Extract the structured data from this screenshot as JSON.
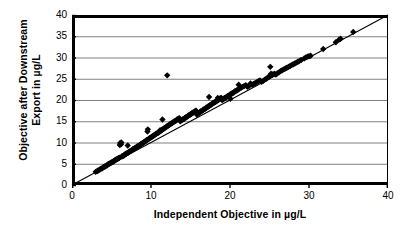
{
  "chart_data": {
    "type": "scatter",
    "title": "",
    "xlabel": "Independent Objective in µg/L",
    "ylabel_line1": "Objective after Downstream",
    "ylabel_line2": "Export in µg/L",
    "xlim": [
      0,
      40
    ],
    "ylim": [
      0,
      40
    ],
    "xticks": [
      0,
      10,
      20,
      30,
      40
    ],
    "yticks": [
      0,
      5,
      10,
      15,
      20,
      25,
      30,
      35,
      40
    ],
    "xtick_labels": [
      "0",
      "10",
      "20",
      "30",
      "40"
    ],
    "ytick_labels": [
      "0",
      "5",
      "10",
      "15",
      "20",
      "25",
      "30",
      "35",
      "40"
    ],
    "grid": "horizontal",
    "grid_color": "#808080",
    "axis_color": "#000000",
    "marker": "diamond",
    "marker_color": "#000000",
    "marker_size": 4.2,
    "legend": null,
    "reference_line": {
      "name": "1:1 line",
      "from": [
        0,
        0
      ],
      "to": [
        40,
        40
      ],
      "color": "#000000",
      "width": 1.1
    },
    "points": [
      [
        3.0,
        3.1
      ],
      [
        3.2,
        3.3
      ],
      [
        3.3,
        3.4
      ],
      [
        3.5,
        3.6
      ],
      [
        3.6,
        3.8
      ],
      [
        3.8,
        3.9
      ],
      [
        3.9,
        4.1
      ],
      [
        4.0,
        4.2
      ],
      [
        4.1,
        4.3
      ],
      [
        4.2,
        4.4
      ],
      [
        4.3,
        4.5
      ],
      [
        4.4,
        4.6
      ],
      [
        4.5,
        4.8
      ],
      [
        4.6,
        4.9
      ],
      [
        4.7,
        5.0
      ],
      [
        4.8,
        5.1
      ],
      [
        4.9,
        5.2
      ],
      [
        5.0,
        5.3
      ],
      [
        5.1,
        5.4
      ],
      [
        5.2,
        5.5
      ],
      [
        5.3,
        5.6
      ],
      [
        5.4,
        5.8
      ],
      [
        5.5,
        5.9
      ],
      [
        5.6,
        6.0
      ],
      [
        5.7,
        6.1
      ],
      [
        5.8,
        6.2
      ],
      [
        5.9,
        6.3
      ],
      [
        6.0,
        6.4
      ],
      [
        6.05,
        9.4
      ],
      [
        6.1,
        9.9
      ],
      [
        6.2,
        9.6
      ],
      [
        6.25,
        10.0
      ],
      [
        6.3,
        6.7
      ],
      [
        6.4,
        6.8
      ],
      [
        6.5,
        6.9
      ],
      [
        6.6,
        7.0
      ],
      [
        6.7,
        7.2
      ],
      [
        6.8,
        7.3
      ],
      [
        6.9,
        7.4
      ],
      [
        7.0,
        7.5
      ],
      [
        7.05,
        9.3
      ],
      [
        7.1,
        7.6
      ],
      [
        7.2,
        7.8
      ],
      [
        7.3,
        7.9
      ],
      [
        7.4,
        8.0
      ],
      [
        7.5,
        8.1
      ],
      [
        7.6,
        8.2
      ],
      [
        7.7,
        8.4
      ],
      [
        7.8,
        8.5
      ],
      [
        7.9,
        8.6
      ],
      [
        8.0,
        8.7
      ],
      [
        8.1,
        8.8
      ],
      [
        8.2,
        9.0
      ],
      [
        8.3,
        9.1
      ],
      [
        8.4,
        9.2
      ],
      [
        8.5,
        9.3
      ],
      [
        8.6,
        9.4
      ],
      [
        8.7,
        9.6
      ],
      [
        8.8,
        9.7
      ],
      [
        8.9,
        9.8
      ],
      [
        9.0,
        9.9
      ],
      [
        9.1,
        10.1
      ],
      [
        9.2,
        10.2
      ],
      [
        9.3,
        10.3
      ],
      [
        9.4,
        10.5
      ],
      [
        9.5,
        10.6
      ],
      [
        9.55,
        12.6
      ],
      [
        9.6,
        13.1
      ],
      [
        9.7,
        10.8
      ],
      [
        9.8,
        11.0
      ],
      [
        9.9,
        11.1
      ],
      [
        10.0,
        11.2
      ],
      [
        10.1,
        11.3
      ],
      [
        10.2,
        11.5
      ],
      [
        10.3,
        11.6
      ],
      [
        10.4,
        11.7
      ],
      [
        10.5,
        11.8
      ],
      [
        10.6,
        12.0
      ],
      [
        10.7,
        12.1
      ],
      [
        10.8,
        12.2
      ],
      [
        10.9,
        12.3
      ],
      [
        11.0,
        12.4
      ],
      [
        11.1,
        12.6
      ],
      [
        11.15,
        12.9
      ],
      [
        11.2,
        12.7
      ],
      [
        11.3,
        12.8
      ],
      [
        11.4,
        13.0
      ],
      [
        11.45,
        15.4
      ],
      [
        11.5,
        13.1
      ],
      [
        11.6,
        13.2
      ],
      [
        11.7,
        13.4
      ],
      [
        11.8,
        13.5
      ],
      [
        11.9,
        13.6
      ],
      [
        12.0,
        13.8
      ],
      [
        12.05,
        25.8
      ],
      [
        12.1,
        13.9
      ],
      [
        12.2,
        14.0
      ],
      [
        12.3,
        14.1
      ],
      [
        12.4,
        14.3
      ],
      [
        12.5,
        14.4
      ],
      [
        12.6,
        14.5
      ],
      [
        12.7,
        14.6
      ],
      [
        12.8,
        14.8
      ],
      [
        12.9,
        14.9
      ],
      [
        13.0,
        15.0
      ],
      [
        13.1,
        15.1
      ],
      [
        13.2,
        15.2
      ],
      [
        13.3,
        15.4
      ],
      [
        13.4,
        15.5
      ],
      [
        13.5,
        15.6
      ],
      [
        13.6,
        15.7
      ],
      [
        13.7,
        15.0
      ],
      [
        13.8,
        15.2
      ],
      [
        13.9,
        15.3
      ],
      [
        14.0,
        15.4
      ],
      [
        14.1,
        15.5
      ],
      [
        14.2,
        15.6
      ],
      [
        14.3,
        15.8
      ],
      [
        14.4,
        15.9
      ],
      [
        14.5,
        16.0
      ],
      [
        14.6,
        16.1
      ],
      [
        14.7,
        16.3
      ],
      [
        14.8,
        16.4
      ],
      [
        14.9,
        16.5
      ],
      [
        15.0,
        16.6
      ],
      [
        15.1,
        16.8
      ],
      [
        15.2,
        16.9
      ],
      [
        15.3,
        17.0
      ],
      [
        15.4,
        17.1
      ],
      [
        15.5,
        17.2
      ],
      [
        15.6,
        17.4
      ],
      [
        15.7,
        17.5
      ],
      [
        15.8,
        16.6
      ],
      [
        15.9,
        16.8
      ],
      [
        16.0,
        16.9
      ],
      [
        16.1,
        17.0
      ],
      [
        16.2,
        17.2
      ],
      [
        16.3,
        17.3
      ],
      [
        16.4,
        17.4
      ],
      [
        16.5,
        17.5
      ],
      [
        16.6,
        17.7
      ],
      [
        16.7,
        17.8
      ],
      [
        16.8,
        17.9
      ],
      [
        16.9,
        18.0
      ],
      [
        17.0,
        18.2
      ],
      [
        17.1,
        18.3
      ],
      [
        17.2,
        18.4
      ],
      [
        17.3,
        18.5
      ],
      [
        17.35,
        20.7
      ],
      [
        17.4,
        18.7
      ],
      [
        17.5,
        18.8
      ],
      [
        17.6,
        18.9
      ],
      [
        17.7,
        19.0
      ],
      [
        17.8,
        19.2
      ],
      [
        17.9,
        19.3
      ],
      [
        18.0,
        19.4
      ],
      [
        18.1,
        19.5
      ],
      [
        18.2,
        19.6
      ],
      [
        18.3,
        19.8
      ],
      [
        18.4,
        19.9
      ],
      [
        18.45,
        20.5
      ],
      [
        18.5,
        20.0
      ],
      [
        18.6,
        20.1
      ],
      [
        18.7,
        20.3
      ],
      [
        18.8,
        20.4
      ],
      [
        18.9,
        20.5
      ],
      [
        19.0,
        20.0
      ],
      [
        19.1,
        20.1
      ],
      [
        19.2,
        20.3
      ],
      [
        19.3,
        20.4
      ],
      [
        19.4,
        20.5
      ],
      [
        19.5,
        20.6
      ],
      [
        19.6,
        20.8
      ],
      [
        19.7,
        20.9
      ],
      [
        19.8,
        21.0
      ],
      [
        19.9,
        21.1
      ],
      [
        20.0,
        21.2
      ],
      [
        20.05,
        20.3
      ],
      [
        20.1,
        21.4
      ],
      [
        20.2,
        21.5
      ],
      [
        20.3,
        21.6
      ],
      [
        20.4,
        21.7
      ],
      [
        20.5,
        21.8
      ],
      [
        20.6,
        22.0
      ],
      [
        20.7,
        22.1
      ],
      [
        20.8,
        22.2
      ],
      [
        20.9,
        22.3
      ],
      [
        21.0,
        22.4
      ],
      [
        21.1,
        23.6
      ],
      [
        21.2,
        22.7
      ],
      [
        21.4,
        22.9
      ],
      [
        21.6,
        23.1
      ],
      [
        21.8,
        23.3
      ],
      [
        22.0,
        23.5
      ],
      [
        22.2,
        23.1
      ],
      [
        22.4,
        23.3
      ],
      [
        22.6,
        23.9
      ],
      [
        22.8,
        23.6
      ],
      [
        23.0,
        23.8
      ],
      [
        23.2,
        24.0
      ],
      [
        23.4,
        24.2
      ],
      [
        23.6,
        24.4
      ],
      [
        23.8,
        24.6
      ],
      [
        24.0,
        24.3
      ],
      [
        24.2,
        24.5
      ],
      [
        24.4,
        24.8
      ],
      [
        24.6,
        25.0
      ],
      [
        24.8,
        25.3
      ],
      [
        25.0,
        25.6
      ],
      [
        25.1,
        27.8
      ],
      [
        25.2,
        26.2
      ],
      [
        25.4,
        26.0
      ],
      [
        25.6,
        26.2
      ],
      [
        25.8,
        26.0
      ],
      [
        26.0,
        26.3
      ],
      [
        26.2,
        26.5
      ],
      [
        26.4,
        26.8
      ],
      [
        26.6,
        27.0
      ],
      [
        26.8,
        27.2
      ],
      [
        27.0,
        27.4
      ],
      [
        27.2,
        27.6
      ],
      [
        27.4,
        27.8
      ],
      [
        27.6,
        28.0
      ],
      [
        27.8,
        28.2
      ],
      [
        28.0,
        28.4
      ],
      [
        28.2,
        28.6
      ],
      [
        28.4,
        28.8
      ],
      [
        28.6,
        29.0
      ],
      [
        28.8,
        29.2
      ],
      [
        29.0,
        29.4
      ],
      [
        29.4,
        29.8
      ],
      [
        29.6,
        30.0
      ],
      [
        29.8,
        30.2
      ],
      [
        30.0,
        30.3
      ],
      [
        30.2,
        30.4
      ],
      [
        31.8,
        32.0
      ],
      [
        33.4,
        33.6
      ],
      [
        33.8,
        34.2
      ],
      [
        34.0,
        34.4
      ],
      [
        35.6,
        36.0
      ]
    ]
  }
}
